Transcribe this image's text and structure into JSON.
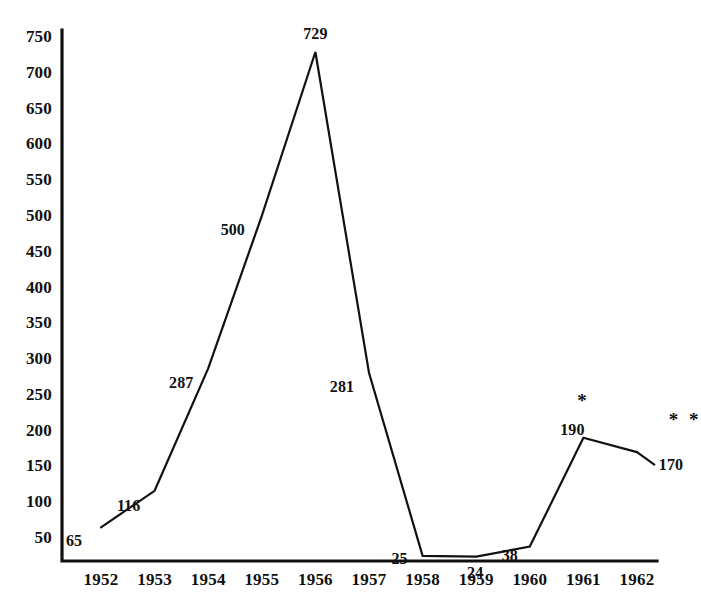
{
  "chart_data": {
    "type": "line",
    "title": "",
    "subtitle": "",
    "xlabel": "",
    "ylabel": "",
    "categories": [
      "1952",
      "1953",
      "1954",
      "1955",
      "1956",
      "1957",
      "1958",
      "1959",
      "1960",
      "1961",
      "1962"
    ],
    "values": [
      65,
      116,
      287,
      500,
      729,
      281,
      25,
      24,
      38,
      190,
      170
    ],
    "point_labels": [
      "65",
      "116",
      "287",
      "500",
      "729",
      "281",
      "25",
      "24",
      "38",
      "190",
      "170"
    ],
    "ylim": [
      0,
      775
    ],
    "yticks": [
      50,
      100,
      150,
      200,
      250,
      300,
      350,
      400,
      450,
      500,
      550,
      600,
      650,
      700,
      750
    ],
    "ytick_labels": [
      "50",
      "100",
      "150",
      "200",
      "250",
      "300",
      "350",
      "400",
      "450",
      "500",
      "550",
      "600",
      "650",
      "700",
      "750"
    ],
    "grid": false,
    "legend": null,
    "legend_position": "none",
    "line_color": "#111111",
    "axis_color": "#111111",
    "background_color": "#ffffff",
    "annotations": [
      {
        "name": "asterisk-1961",
        "text": "*",
        "category": "1961",
        "value": 243
      },
      {
        "name": "asterisk-1962",
        "text": "* *",
        "category": "1962",
        "value": 217
      }
    ]
  }
}
